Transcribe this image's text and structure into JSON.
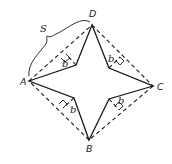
{
  "diagram": {
    "vertices": [
      {
        "id": "A",
        "label": "A",
        "x": 29,
        "y": 81
      },
      {
        "id": "D",
        "label": "D",
        "x": 92,
        "y": 25
      },
      {
        "id": "C",
        "label": "C",
        "x": 153,
        "y": 86
      },
      {
        "id": "B",
        "label": "B",
        "x": 89,
        "y": 140
      }
    ],
    "inner_vertices": [
      {
        "id": "upper-left",
        "x": 76,
        "y": 65
      },
      {
        "id": "upper-right",
        "x": 109,
        "y": 68
      },
      {
        "id": "lower-right",
        "x": 109,
        "y": 99
      },
      {
        "id": "lower-left",
        "x": 74,
        "y": 98
      }
    ],
    "side_label": "S",
    "height_labels": [
      "b",
      "b",
      "b",
      "b"
    ],
    "square_edges_style": "dashed",
    "star_edges_style": "solid",
    "stroke_color": "#1a1a1a",
    "background": "#ffffff"
  }
}
